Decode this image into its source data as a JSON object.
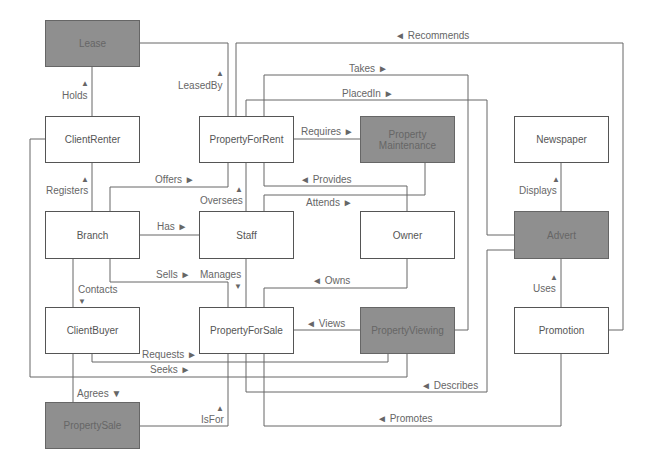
{
  "diagram": {
    "entities": [
      {
        "id": "lease",
        "label": "Lease",
        "shaded": true
      },
      {
        "id": "clientrenter",
        "label": "ClientRenter",
        "shaded": false
      },
      {
        "id": "propertyforrent",
        "label": "PropertyForRent",
        "shaded": false
      },
      {
        "id": "propertymaintenance",
        "label": "Property Maintenance",
        "shaded": true
      },
      {
        "id": "newspaper",
        "label": "Newspaper",
        "shaded": false
      },
      {
        "id": "branch",
        "label": "Branch",
        "shaded": false
      },
      {
        "id": "staff",
        "label": "Staff",
        "shaded": false
      },
      {
        "id": "owner",
        "label": "Owner",
        "shaded": false
      },
      {
        "id": "advert",
        "label": "Advert",
        "shaded": true
      },
      {
        "id": "clientbuyer",
        "label": "ClientBuyer",
        "shaded": false
      },
      {
        "id": "propertyforsale",
        "label": "PropertyForSale",
        "shaded": false
      },
      {
        "id": "propertyviewing",
        "label": "PropertyViewing",
        "shaded": true
      },
      {
        "id": "promotion",
        "label": "Promotion",
        "shaded": false
      },
      {
        "id": "propertysale",
        "label": "PropertySale",
        "shaded": true
      }
    ],
    "relationships": [
      {
        "id": "recommends",
        "label": "◄ Recommends"
      },
      {
        "id": "takes",
        "label": "Takes ►"
      },
      {
        "id": "placedin",
        "label": "PlacedIn ►"
      },
      {
        "id": "holds",
        "label": "Holds"
      },
      {
        "id": "holds_arrow",
        "label": "▲"
      },
      {
        "id": "leasedby",
        "label": "LeasedBy"
      },
      {
        "id": "leasedby_arrow",
        "label": "▲"
      },
      {
        "id": "requires",
        "label": "Requires ►"
      },
      {
        "id": "provides",
        "label": "◄ Provides"
      },
      {
        "id": "attends",
        "label": "Attends ►"
      },
      {
        "id": "registers",
        "label": "Registers"
      },
      {
        "id": "registers_arrow",
        "label": "▲"
      },
      {
        "id": "offers",
        "label": "Offers ►"
      },
      {
        "id": "oversees",
        "label": "Oversees"
      },
      {
        "id": "oversees_arrow",
        "label": "▲"
      },
      {
        "id": "displays",
        "label": "Displays"
      },
      {
        "id": "displays_arrow",
        "label": "▲"
      },
      {
        "id": "has",
        "label": "Has ►"
      },
      {
        "id": "sells",
        "label": "Sells ►"
      },
      {
        "id": "manages",
        "label": "Manages"
      },
      {
        "id": "manages_arrow",
        "label": "▼"
      },
      {
        "id": "owns",
        "label": "◄ Owns"
      },
      {
        "id": "contacts",
        "label": "Contacts"
      },
      {
        "id": "contacts_arrow",
        "label": "▼"
      },
      {
        "id": "uses",
        "label": "Uses"
      },
      {
        "id": "uses_arrow",
        "label": "▲"
      },
      {
        "id": "views",
        "label": "◄ Views"
      },
      {
        "id": "requests",
        "label": "Requests ►"
      },
      {
        "id": "seeks",
        "label": "Seeks ►"
      },
      {
        "id": "describes",
        "label": "◄ Describes"
      },
      {
        "id": "agrees",
        "label": "Agrees ▼"
      },
      {
        "id": "isfor",
        "label": "IsFor"
      },
      {
        "id": "isfor_arrow",
        "label": "▲"
      },
      {
        "id": "promotes",
        "label": "◄ Promotes"
      }
    ]
  },
  "colors": {
    "line": "#666666",
    "shaded_fill": "#8f8f8f",
    "box_fill": "#ffffff",
    "text": "#666666"
  }
}
